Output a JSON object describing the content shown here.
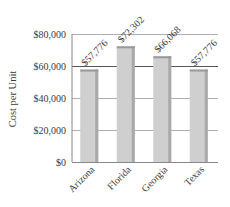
{
  "chart_data": {
    "type": "bar",
    "title": "",
    "xlabel": "",
    "ylabel": "Cost per Unit",
    "categories": [
      "Arizona",
      "Florida",
      "Georgia",
      "Texas"
    ],
    "values": [
      57776,
      72302,
      66068,
      57776
    ],
    "data_labels": [
      "$57,776",
      "$72,302",
      "$66,068",
      "$57,776"
    ],
    "ylim": [
      0,
      80000
    ],
    "yticks": [
      0,
      20000,
      40000,
      60000,
      80000
    ],
    "ytick_labels": [
      "$0",
      "$20,000",
      "$40,000",
      "$60,000",
      "$80,000"
    ],
    "grid": true,
    "legend": null,
    "bar_color": "#cfcfcf"
  }
}
